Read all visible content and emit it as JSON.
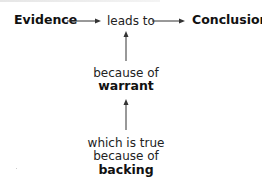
{
  "diagram": {
    "nodes": {
      "evidence": "Evidence",
      "leads_to": "leads to",
      "conclusion": "Conclusion",
      "because_of_1": "because of",
      "warrant": "warrant",
      "which_is_true": "which is true",
      "because_of_2": "because of",
      "backing": "backing"
    },
    "edges": [
      {
        "from": "Evidence",
        "to": "leads to",
        "direction": "right"
      },
      {
        "from": "leads to",
        "to": "Conclusion",
        "direction": "right"
      },
      {
        "from": "warrant",
        "to": "leads to",
        "direction": "up"
      },
      {
        "from": "backing",
        "to": "warrant",
        "direction": "up"
      }
    ],
    "colors": {
      "text": "#1a1a1a",
      "arrow": "#333333",
      "background": "#ffffff"
    }
  }
}
